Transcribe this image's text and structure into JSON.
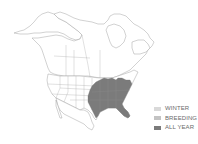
{
  "map": {
    "type": "range-map",
    "region": "North America",
    "outline_color": "#8a8a8a",
    "land_color": "#ffffff",
    "range_color": "#7b7b7b",
    "range_description": "Eastern United States, all year"
  },
  "legend": {
    "items": [
      {
        "label": "WINTER",
        "color": "#d9d9d9"
      },
      {
        "label": "BREEDING",
        "color": "#c3c3c3"
      },
      {
        "label": "ALL YEAR",
        "color": "#7b7b7b"
      }
    ]
  }
}
